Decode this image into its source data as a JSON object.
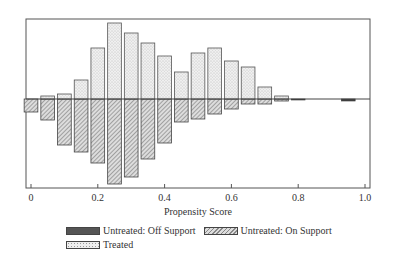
{
  "chart_data": {
    "type": "bar",
    "subtype": "mirrored histogram",
    "title": "",
    "xlabel": "Propensity Score",
    "ylabel": "",
    "xlim": [
      0,
      1.0
    ],
    "x_ticks": [
      "0",
      "0.2",
      "0.4",
      "0.6",
      "0.8",
      "1.0"
    ],
    "bin_width": 0.05,
    "bins": [
      0.0,
      0.05,
      0.1,
      0.15,
      0.2,
      0.25,
      0.3,
      0.35,
      0.4,
      0.45,
      0.5,
      0.55,
      0.6,
      0.65,
      0.7,
      0.75,
      0.8,
      0.85,
      0.9,
      0.95
    ],
    "series": [
      {
        "name": "Treated",
        "direction": "up",
        "pattern": "dotted",
        "values": [
          0,
          3,
          5,
          19,
          51,
          76,
          66,
          56,
          43,
          27,
          46,
          51,
          38,
          32,
          12,
          3,
          0,
          0,
          0,
          0
        ]
      },
      {
        "name": "Untreated: On Support",
        "direction": "down",
        "pattern": "hatched",
        "values": [
          13,
          21,
          46,
          53,
          64,
          85,
          78,
          60,
          44,
          23,
          20,
          15,
          10,
          5,
          5,
          2,
          0,
          0,
          0,
          0
        ]
      },
      {
        "name": "Untreated: Off Support",
        "direction": "down",
        "pattern": "solid-dark",
        "values": [
          0,
          0,
          0,
          0,
          0,
          0,
          0,
          0,
          0,
          0,
          0,
          0,
          0,
          0,
          0,
          0,
          1,
          0,
          0,
          2
        ]
      }
    ],
    "legend": [
      "Untreated: Off Support",
      "Untreated: On Support",
      "Treated"
    ],
    "legend_position": "bottom",
    "grid": false
  },
  "legend": {
    "off_support": "Untreated: Off Support",
    "on_support": "Untreated: On Support",
    "treated": "Treated"
  },
  "axis": {
    "xlabel": "Propensity Score"
  }
}
